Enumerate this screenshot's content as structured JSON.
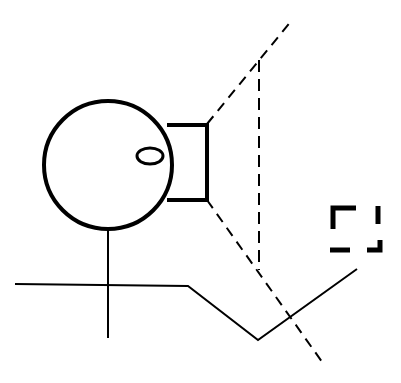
{
  "diagram": {
    "stroke_color": "#000000",
    "background": "#ffffff",
    "elements": [
      {
        "name": "observer-head",
        "shape": "circle",
        "cx": 108,
        "cy": 165,
        "r": 64
      },
      {
        "name": "eye",
        "shape": "ellipse",
        "cx": 150,
        "cy": 156,
        "rx": 13,
        "ry": 8
      },
      {
        "name": "camera-box",
        "shape": "rect",
        "x": 166,
        "y": 125,
        "w": 41,
        "h": 75
      },
      {
        "name": "view-ray-upper",
        "shape": "dashed-line",
        "from": [
          207,
          124
        ],
        "to": [
          292,
          20
        ]
      },
      {
        "name": "view-ray-lower",
        "shape": "dashed-line",
        "from": [
          207,
          200
        ],
        "to": [
          325,
          366
        ]
      },
      {
        "name": "view-plane",
        "shape": "dashed-line",
        "from": [
          259,
          60
        ],
        "to": [
          259,
          270
        ]
      },
      {
        "name": "body-axis",
        "shape": "line",
        "from": [
          108,
          230
        ],
        "to": [
          108,
          338
        ]
      },
      {
        "name": "ground-path",
        "shape": "polyline",
        "points": [
          [
            15,
            284
          ],
          [
            188,
            286
          ],
          [
            258,
            340
          ],
          [
            357,
            269
          ]
        ]
      },
      {
        "name": "target-frame",
        "shape": "dashed-square",
        "x": 331,
        "y": 205,
        "w": 50,
        "h": 48
      }
    ]
  }
}
